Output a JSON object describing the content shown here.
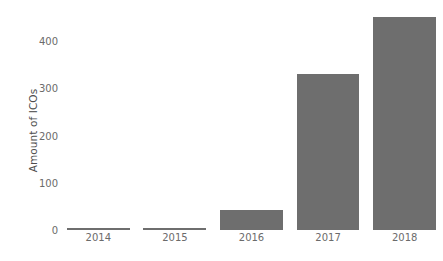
{
  "chart_data": {
    "type": "bar",
    "title": "",
    "subtitle": "",
    "xlabel": "",
    "ylabel": "Amount of ICOs",
    "categories": [
      "2014",
      "2015",
      "2016",
      "2017",
      "2018"
    ],
    "values": [
      4,
      3,
      42,
      330,
      450
    ],
    "series": [
      {
        "name": "Amount of ICOs",
        "values": [
          4,
          3,
          42,
          330,
          450
        ]
      }
    ],
    "ylim": [
      0,
      470
    ],
    "yticks": [
      0,
      100,
      200,
      300,
      400
    ],
    "ytick_labels": [
      "0",
      "100",
      "200",
      "300",
      "400"
    ],
    "grid": false,
    "legend": false,
    "legend_position": "none",
    "bar_color": "#6e6e6e",
    "axis_text_color": "#6b6b6b",
    "background_color": "#ffffff"
  }
}
